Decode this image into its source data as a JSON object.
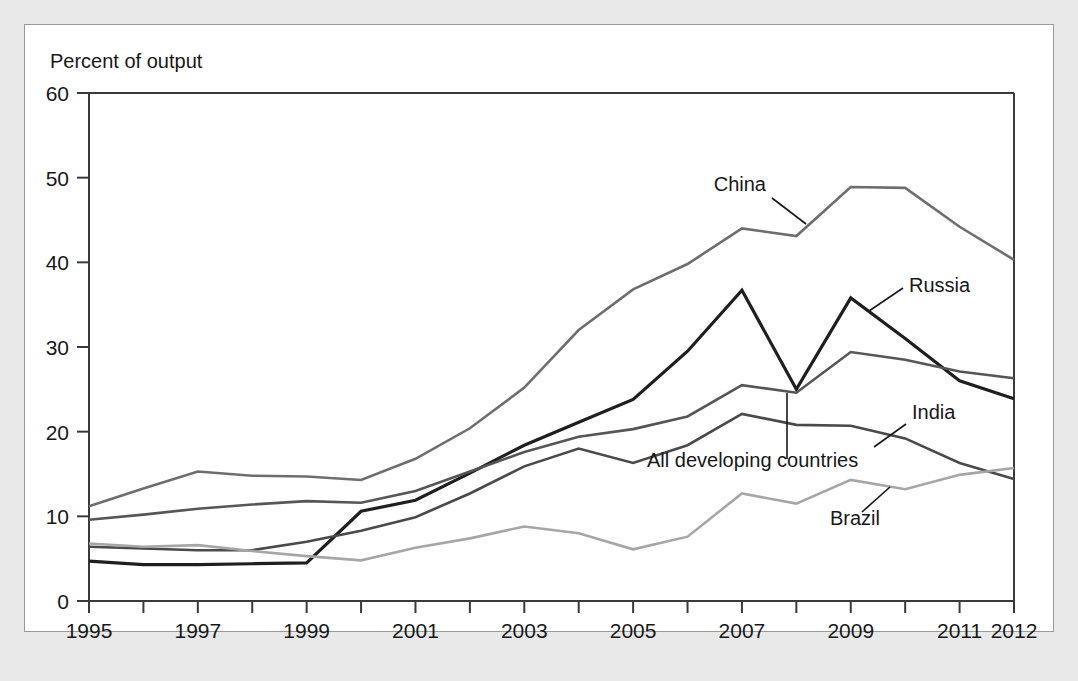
{
  "figure": {
    "background_color": "#e9e9e9",
    "panel_color": "#ffffff",
    "panel_border_color": "#9a9a9a"
  },
  "chart_data": {
    "type": "line",
    "title": "",
    "subtitle": "",
    "ylabel": "Percent of output",
    "xlabel": "",
    "ylim": [
      0,
      60
    ],
    "xlim": [
      1995,
      2012
    ],
    "yticks": [
      0,
      10,
      20,
      30,
      40,
      50,
      60
    ],
    "ytick_labels": [
      "0",
      "10",
      "20",
      "30",
      "40",
      "50",
      "60"
    ],
    "xticks": [
      1995,
      1996,
      1997,
      1998,
      1999,
      2000,
      2001,
      2002,
      2003,
      2004,
      2005,
      2006,
      2007,
      2008,
      2009,
      2010,
      2011,
      2012
    ],
    "xtick_labels": [
      "1995",
      "",
      "1997",
      "",
      "1999",
      "",
      "2001",
      "",
      "2003",
      "",
      "2005",
      "",
      "2007",
      "",
      "2009",
      "",
      "2011",
      "2012"
    ],
    "grid": false,
    "legend_position": "inline-annotations",
    "x": [
      1995,
      1996,
      1997,
      1998,
      1999,
      2000,
      2001,
      2002,
      2003,
      2004,
      2005,
      2006,
      2007,
      2008,
      2009,
      2010,
      2011,
      2012
    ],
    "series": [
      {
        "name": "China",
        "color": "#6e6e6e",
        "width": 2.6,
        "values": [
          11.2,
          13.3,
          15.3,
          14.8,
          14.7,
          14.3,
          16.8,
          20.4,
          25.2,
          32.0,
          36.8,
          39.8,
          44.0,
          43.1,
          48.9,
          48.8,
          44.2,
          40.3
        ]
      },
      {
        "name": "Russia",
        "color": "#1f1f1f",
        "width": 3.2,
        "values": [
          4.7,
          4.3,
          4.3,
          4.4,
          4.5,
          10.6,
          11.9,
          15.1,
          18.4,
          21.1,
          23.8,
          29.5,
          36.7,
          25.0,
          35.8,
          31.0,
          26.0,
          23.9
        ]
      },
      {
        "name": "India",
        "color": "#4a4a4a",
        "width": 2.6,
        "values": [
          6.4,
          6.2,
          6.0,
          6.0,
          7.0,
          8.3,
          9.9,
          12.7,
          15.9,
          18.0,
          16.3,
          18.4,
          22.1,
          20.8,
          20.7,
          19.2,
          16.3,
          14.4
        ]
      },
      {
        "name": "All developing countries",
        "color": "#565656",
        "width": 2.6,
        "values": [
          9.6,
          10.2,
          10.9,
          11.4,
          11.8,
          11.6,
          13.0,
          15.3,
          17.6,
          19.4,
          20.3,
          21.8,
          25.5,
          24.6,
          29.4,
          28.5,
          27.1,
          26.3
        ]
      },
      {
        "name": "Brazil",
        "color": "#a6a6a6",
        "width": 2.6,
        "values": [
          6.8,
          6.4,
          6.6,
          5.9,
          5.3,
          4.8,
          6.3,
          7.4,
          8.8,
          8.0,
          6.1,
          7.6,
          12.7,
          11.5,
          14.3,
          13.2,
          14.9,
          15.7
        ]
      }
    ],
    "annotations": [
      {
        "label": "China",
        "text_x": 766,
        "text_y": 191,
        "anchor": "end",
        "leader": [
          [
            772,
            198
          ],
          [
            806,
            224
          ]
        ]
      },
      {
        "label": "Russia",
        "text_x": 909,
        "text_y": 292,
        "anchor": "start",
        "leader": [
          [
            903,
            288
          ],
          [
            869,
            311
          ]
        ]
      },
      {
        "label": "India",
        "text_x": 912,
        "text_y": 419,
        "anchor": "start",
        "leader": [
          [
            906,
            424
          ],
          [
            874,
            447
          ]
        ]
      },
      {
        "label": "All developing countries",
        "text_x": 647,
        "text_y": 467,
        "anchor": "start",
        "leader": [
          [
            787,
            459
          ],
          [
            787,
            393
          ]
        ]
      },
      {
        "label": "Brazil",
        "text_x": 830,
        "text_y": 525,
        "anchor": "start",
        "leader": [
          [
            862,
            512
          ],
          [
            890,
            487
          ]
        ]
      }
    ]
  }
}
